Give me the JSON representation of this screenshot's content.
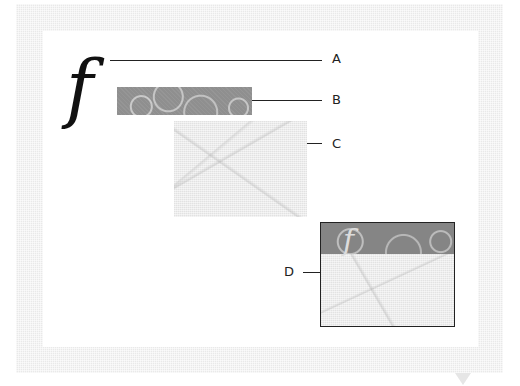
{
  "diagram": {
    "type": "layer-composition-illustration",
    "glyph": "f",
    "callouts": [
      {
        "id": "A",
        "label": "A",
        "target": "letter f glyph"
      },
      {
        "id": "B",
        "label": "B",
        "target": "gray circle-pattern banner"
      },
      {
        "id": "C",
        "label": "C",
        "target": "light paper texture"
      },
      {
        "id": "D",
        "label": "D",
        "target": "composite result"
      }
    ],
    "composite": {
      "glyph": "f"
    },
    "colors": {
      "frame": "#e9e9e9",
      "canvas": "#ffffff",
      "banner": "#8f8f8f",
      "paper": "#ececec",
      "line": "#222222"
    }
  }
}
